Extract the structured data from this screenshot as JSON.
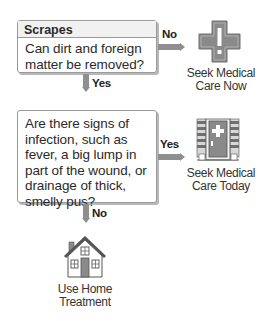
{
  "flowchart": {
    "title": "Scrapes",
    "questions": [
      {
        "id": "q1",
        "header": "Scrapes",
        "text": "Can dirt and foreign matter be removed?"
      },
      {
        "id": "q2",
        "header": "",
        "text": "Are there signs of infection, such as fever, a big lump in part of the wound, or drainage of thick, smelly pus?"
      }
    ],
    "edges": [
      {
        "from": "q1",
        "to": "care_now",
        "label": "No"
      },
      {
        "from": "q1",
        "to": "q2",
        "label": "Yes"
      },
      {
        "from": "q2",
        "to": "care_today",
        "label": "Yes"
      },
      {
        "from": "q2",
        "to": "home",
        "label": "No"
      }
    ],
    "outcomes": {
      "care_now": {
        "icon": "emergency-cross-icon",
        "line1": "Seek Medical",
        "line2": "Care Now"
      },
      "care_today": {
        "icon": "clinic-door-icon",
        "line1": "Seek Medical",
        "line2": "Care Today"
      },
      "home": {
        "icon": "house-icon",
        "line1": "Use Home",
        "line2": "Treatment"
      }
    }
  },
  "colors": {
    "arrow": "#8f8f8f",
    "box_border": "#9a9a9a",
    "icon_fill": "#8a8a8a",
    "text": "#2a2a2a"
  }
}
